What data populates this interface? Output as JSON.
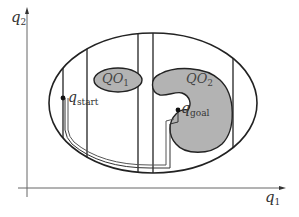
{
  "diagram": {
    "axes": {
      "x_label": "q",
      "x_label_sub": "1",
      "y_label": "q",
      "y_label_sub": "2"
    },
    "obstacles": [
      {
        "label": "QO",
        "sub": "1",
        "fill": "#b3b3b3"
      },
      {
        "label": "QO",
        "sub": "2",
        "fill": "#b3b3b3"
      }
    ],
    "points": {
      "start": {
        "label": "q",
        "sub": "start"
      },
      "goal": {
        "label": "q",
        "sub": "goal"
      }
    },
    "colors": {
      "stroke": "#222222",
      "obstacle_fill": "#b3b3b3",
      "axis": "#555555",
      "background": "#ffffff"
    }
  }
}
